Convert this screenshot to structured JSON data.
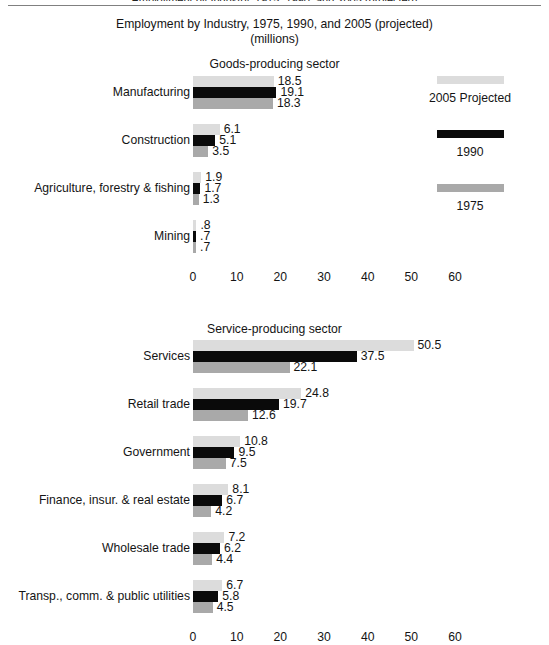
{
  "clipped_header": "Employment by Industry, 1975, 1990, and 2005 (projected)",
  "title": {
    "line1": "Employment by Industry, 1975, 1990, and 2005 (projected)",
    "line2": "(millions)"
  },
  "sections": {
    "goods": "Goods-producing sector",
    "service": "Service-producing sector"
  },
  "legend": {
    "items": [
      {
        "label": "2005 Projected",
        "color": "#dcdcdc",
        "key": "c2005"
      },
      {
        "label": "1990",
        "color": "#0a0a0a",
        "key": "c1990"
      },
      {
        "label": "1975",
        "color": "#a9a9a9",
        "key": "c1975"
      }
    ]
  },
  "axis": {
    "ticks": [
      "0",
      "10",
      "20",
      "30",
      "40",
      "50",
      "60"
    ],
    "min": 0,
    "max": 60,
    "step": 10
  },
  "chart_data": {
    "type": "bar",
    "title": "Employment by Industry, 1975, 1990, and 2005 (projected)",
    "subtitle": "(millions)",
    "xlabel": "",
    "ylabel": "",
    "xlim": [
      0,
      60
    ],
    "grid": false,
    "orientation": "horizontal",
    "legend_position": "right",
    "series_order": [
      "2005 Projected",
      "1990",
      "1975"
    ],
    "panels": [
      {
        "name": "Goods-producing sector",
        "categories": [
          "Manufacturing",
          "Construction",
          "Agriculture, forestry & fishing",
          "Mining"
        ],
        "series": [
          {
            "name": "2005 Projected",
            "color": "#dcdcdc",
            "values": [
              18.5,
              6.1,
              1.9,
              0.8
            ],
            "labels": [
              "18.5",
              "6.1",
              "1.9",
              ".8"
            ]
          },
          {
            "name": "1990",
            "color": "#0a0a0a",
            "values": [
              19.1,
              5.1,
              1.7,
              0.7
            ],
            "labels": [
              "19.1",
              "5.1",
              "1.7",
              ".7"
            ]
          },
          {
            "name": "1975",
            "color": "#a9a9a9",
            "values": [
              18.3,
              3.5,
              1.3,
              0.7
            ],
            "labels": [
              "18.3",
              "3.5",
              "1.3",
              ".7"
            ]
          }
        ]
      },
      {
        "name": "Service-producing sector",
        "categories": [
          "Services",
          "Retail trade",
          "Government",
          "Finance, insur. & real estate",
          "Wholesale trade",
          "Transp., comm. & public utilities"
        ],
        "series": [
          {
            "name": "2005 Projected",
            "color": "#dcdcdc",
            "values": [
              50.5,
              24.8,
              10.8,
              8.1,
              7.2,
              6.7
            ],
            "labels": [
              "50.5",
              "24.8",
              "10.8",
              "8.1",
              "7.2",
              "6.7"
            ]
          },
          {
            "name": "1990",
            "color": "#0a0a0a",
            "values": [
              37.5,
              19.7,
              9.5,
              6.7,
              6.2,
              5.8
            ],
            "labels": [
              "37.5",
              "19.7",
              "9.5",
              "6.7",
              "6.2",
              "5.8"
            ]
          },
          {
            "name": "1975",
            "color": "#a9a9a9",
            "values": [
              22.1,
              12.6,
              7.5,
              4.2,
              4.4,
              4.5
            ],
            "labels": [
              "22.1",
              "12.6",
              "7.5",
              "4.2",
              "4.4",
              "4.5"
            ]
          }
        ]
      }
    ]
  }
}
